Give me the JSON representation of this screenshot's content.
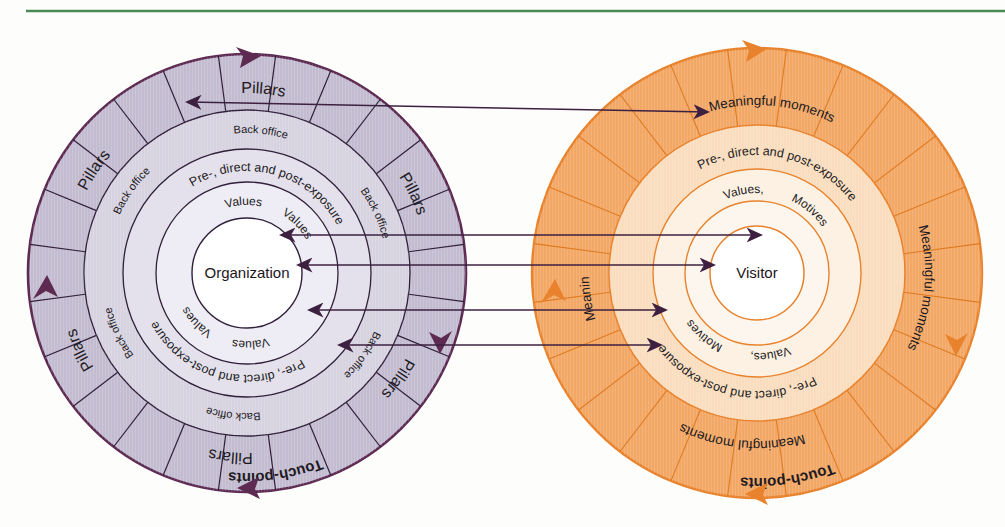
{
  "page": {
    "background": "#fdfdfc",
    "divider": {
      "color": "#4a8a55",
      "name": "top-rule"
    }
  },
  "diagram": {
    "type": "concentric-circles-comparison",
    "left_circle": {
      "title": "Organization model",
      "center_label": "Organization",
      "accent": "#5d2a52",
      "fill_outer": "#c3bcd0",
      "fill_ring2": "#d7d2e0",
      "fill_ring3": "#e4e1ec",
      "fill_ring4": "#f0eef5",
      "fill_center": "#ffffff",
      "segments": 24,
      "rings": [
        {
          "name": "touchpoints-ring",
          "label": "Touch-points",
          "repeats": 1,
          "highlight": true
        },
        {
          "name": "pillars-ring",
          "label": "Pillars",
          "repeats": 6
        },
        {
          "name": "back-office-ring",
          "label": "Back office",
          "repeats": 6
        },
        {
          "name": "exposure-ring",
          "label": "Pre-, direct and post-exposure",
          "repeats": 2
        },
        {
          "name": "values-ring",
          "label": "Values",
          "repeats": 4
        }
      ],
      "labels": {
        "touchpoints": "Touch-points",
        "pillars": "Pillars",
        "back_office": "Back office",
        "exposure": "Pre-, direct and post-exposure",
        "values": "Values"
      }
    },
    "right_circle": {
      "title": "Visitor model",
      "center_label": "Visitor",
      "accent": "#e8822c",
      "fill_outer": "#f2a765",
      "fill_ring2": "#f7d9b6",
      "fill_ring3": "#fbeedd",
      "fill_ring4": "#fdf6ee",
      "fill_center": "#ffffff",
      "segments": 24,
      "rings": [
        {
          "name": "touchpoints-ring",
          "label": "Touch-points",
          "repeats": 1,
          "highlight": true
        },
        {
          "name": "meaningful-moments-ring",
          "label": "Meaningful moments",
          "repeats": 4
        },
        {
          "name": "exposure-ring",
          "label": "Pre-, direct and post-exposure",
          "repeats": 2
        },
        {
          "name": "values-motives-ring",
          "label": "Values, Motives",
          "repeats": 2
        }
      ],
      "labels": {
        "touchpoints": "Touch-points",
        "meaningful_moments": "Meaningful moments",
        "exposure": "Pre-, direct and post-exposure",
        "values": "Values,",
        "motives": "Motives"
      }
    },
    "connectors": {
      "color": "#3d2040",
      "count": 4,
      "items": [
        {
          "name": "connector-touchpoints",
          "from_ring": "Touch-points",
          "to_ring": "Touch-points"
        },
        {
          "name": "connector-pillars-moments",
          "from_ring": "Pillars",
          "to_ring": "Meaningful moments"
        },
        {
          "name": "connector-values",
          "from_ring": "Values",
          "to_ring": "Values, Motives"
        },
        {
          "name": "connector-backoffice-exposure",
          "from_ring": "Back office",
          "to_ring": "Pre-, direct and post-exposure"
        }
      ]
    }
  }
}
